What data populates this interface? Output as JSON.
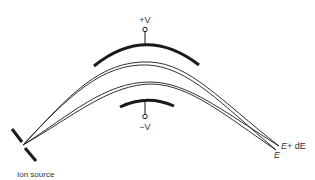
{
  "diagram": {
    "type": "electrostatic-energy-analyzer",
    "colors": {
      "background": "#ffffff",
      "stroke": "#1a1a1a",
      "text": "#333333"
    },
    "electrodes": {
      "outer": {
        "label": "+V",
        "polarity": "positive"
      },
      "inner": {
        "label": "−V",
        "polarity": "negative"
      }
    },
    "source": {
      "label": "Ion source"
    },
    "outputs": [
      {
        "label_main": "E+",
        "label_suffix": " dE"
      },
      {
        "label_main": "E"
      }
    ]
  }
}
